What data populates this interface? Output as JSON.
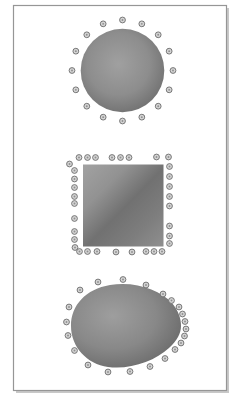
{
  "figure": {
    "canvas": {
      "width": 241,
      "height": 403,
      "background": "#ffffff"
    },
    "frame": {
      "x": 13.5,
      "y": 5.5,
      "width": 213,
      "height": 385,
      "fill": "#ffffff",
      "border_color": "#969696",
      "shadow_color": "#c8c8c8",
      "shadow_offset": 2.5
    },
    "dot_style": {
      "fill": "#d4d4d4",
      "stroke": "#6d6d6d",
      "stroke_width": 0.9,
      "radius": 2.9,
      "core_fill": "#909090",
      "core_radius": 0.95
    },
    "shapes": [
      {
        "id": "sphere",
        "type": "circle",
        "cx": 122.5,
        "cy": 70.5,
        "r": 41.8,
        "gradient": {
          "kind": "radial",
          "cx": 0.45,
          "cy": 0.42,
          "r": 0.68,
          "stops": [
            [
              "0%",
              "#a0a0a0"
            ],
            [
              "55%",
              "#8d8d8d"
            ],
            [
              "100%",
              "#696969"
            ]
          ]
        },
        "dots": {
          "mode": "ring",
          "count": 16,
          "radius": 50.5,
          "start_angle": -90
        }
      },
      {
        "id": "cube",
        "type": "rect",
        "x": 83,
        "y": 164.5,
        "width": 80.5,
        "height": 82,
        "gradient": {
          "kind": "linear",
          "x1": 0,
          "y1": 0,
          "x2": 1,
          "y2": 1,
          "stops": [
            [
              "0%",
              "#a2a2a2"
            ],
            [
              "28%",
              "#929292"
            ],
            [
              "52%",
              "#717171"
            ],
            [
              "75%",
              "#7d7d7d"
            ],
            [
              "100%",
              "#8f8f8f"
            ]
          ]
        },
        "dots": {
          "mode": "list",
          "points": [
            [
              79,
              157.5
            ],
            [
              87.5,
              157.5
            ],
            [
              95.5,
              157.5
            ],
            [
              112,
              157.5
            ],
            [
              120.5,
              157.5
            ],
            [
              129,
              157.5
            ],
            [
              156.5,
              157
            ],
            [
              168.5,
              157
            ],
            [
              69.5,
              164
            ],
            [
              74.5,
              170.5
            ],
            [
              74.5,
              179
            ],
            [
              74.5,
              187.5
            ],
            [
              74.5,
              196.5
            ],
            [
              74.5,
              203.5
            ],
            [
              74.5,
              218.5
            ],
            [
              74.5,
              231.5
            ],
            [
              74.5,
              239.5
            ],
            [
              75,
              247.5
            ],
            [
              79.5,
              251.5
            ],
            [
              87.5,
              251.5
            ],
            [
              97,
              251.5
            ],
            [
              116,
              252
            ],
            [
              132,
              252
            ],
            [
              146,
              251.5
            ],
            [
              154,
              251.5
            ],
            [
              162,
              251.5
            ],
            [
              169.5,
              166.5
            ],
            [
              169.5,
              176.5
            ],
            [
              169.5,
              186.5
            ],
            [
              169.5,
              196.5
            ],
            [
              169.5,
              206
            ],
            [
              169.5,
              226
            ],
            [
              169.5,
              236
            ],
            [
              169.5,
              243.5
            ]
          ]
        }
      },
      {
        "id": "egg",
        "type": "path",
        "d": "M 71 326 C 71 305, 86 289, 110 285 C 136 281, 160 290, 172 303 C 178 310, 181 318, 181 326 C 181 333, 177 341, 169 348 C 155 361, 130 370, 108 367 C 87 364, 71 347, 71 326 Z",
        "gradient": {
          "kind": "radial",
          "cx": 0.38,
          "cy": 0.38,
          "r": 0.72,
          "stops": [
            [
              "0%",
              "#9e9e9e"
            ],
            [
              "55%",
              "#888888"
            ],
            [
              "100%",
              "#686868"
            ]
          ]
        },
        "dots": {
          "mode": "list",
          "points": [
            [
              80,
              290
            ],
            [
              98,
              282
            ],
            [
              123,
              279.5
            ],
            [
              146,
              285
            ],
            [
              163,
              294
            ],
            [
              171.5,
              300.5
            ],
            [
              179,
              307
            ],
            [
              182.5,
              314
            ],
            [
              185,
              321.5
            ],
            [
              186,
              329
            ],
            [
              184.5,
              336
            ],
            [
              181,
              343
            ],
            [
              175,
              349.5
            ],
            [
              165,
              358.5
            ],
            [
              150,
              366.5
            ],
            [
              130,
              371.5
            ],
            [
              108,
              372
            ],
            [
              88,
              365
            ],
            [
              74.5,
              350.5
            ],
            [
              68,
              335.5
            ],
            [
              66.5,
              322
            ],
            [
              69,
              307
            ]
          ]
        }
      }
    ]
  }
}
